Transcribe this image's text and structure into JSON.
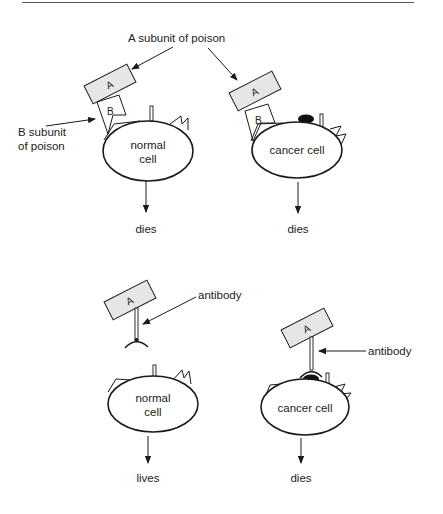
{
  "diagram": {
    "colors": {
      "stroke": "#1a1a1a",
      "subunit_fill": "#e6e6e6",
      "receptor_fill": "#111111",
      "rule": "#555555"
    },
    "top_panel": {
      "callouts": {
        "a_subunit": "A subunit of poison",
        "b_subunit_line1": "B subunit",
        "b_subunit_line2": "of poison"
      },
      "left": {
        "subunit_a": "A",
        "subunit_b": "B",
        "cell_line1": "normal",
        "cell_line2": "cell",
        "outcome": "dies"
      },
      "right": {
        "subunit_a": "A",
        "subunit_b": "B",
        "cell_label": "cancer cell",
        "outcome": "dies"
      }
    },
    "bottom_panel": {
      "left": {
        "subunit_a": "A",
        "antibody_label": "antibody",
        "cell_line1": "normal",
        "cell_line2": "cell",
        "outcome": "lives"
      },
      "right": {
        "subunit_a": "A",
        "antibody_label": "antibody",
        "cell_label": "cancer cell",
        "outcome": "dies"
      }
    }
  }
}
